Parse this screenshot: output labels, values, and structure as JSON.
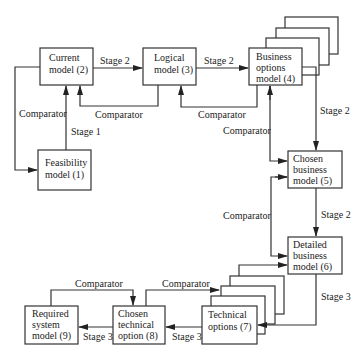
{
  "diagram": {
    "nodes": {
      "feasibility": [
        "Feasibility",
        "model (1)"
      ],
      "current": [
        "Current",
        "model (2)"
      ],
      "logical": [
        "Logical",
        "model (3)"
      ],
      "business_options": [
        "Business",
        "options",
        "model (4)"
      ],
      "chosen_business": [
        "Chosen",
        "business",
        "model (5)"
      ],
      "detailed_business": [
        "Detailed",
        "business",
        "model (6)"
      ],
      "technical_options": [
        "Technical",
        "options (7)"
      ],
      "chosen_technical": [
        "Chosen",
        "technical",
        "option (8)"
      ],
      "required_system": [
        "Required",
        "system",
        "model (9)"
      ]
    },
    "edge_labels": {
      "stage1": "Stage 1",
      "stage2_current_logical": "Stage 2",
      "stage2_logical_business": "Stage 2",
      "stage2_business_chosen": "Stage 2",
      "stage2_chosen_detailed": "Stage 2",
      "stage3_detailed_technical": "Stage 3",
      "stage3_technical_chosen": "Stage 3",
      "stage3_chosen_required": "Stage 3",
      "comparator_current_feasibility": "Comparator",
      "comparator_logical_current": "Comparator",
      "comparator_business_logical": "Comparator",
      "comparator_business_chosen": "Comparator",
      "comparator_chosen_detailed": "Comparator",
      "comparator_chosen_technical_options": "Comparator",
      "comparator_required_chosen_technical": "Comparator"
    }
  }
}
